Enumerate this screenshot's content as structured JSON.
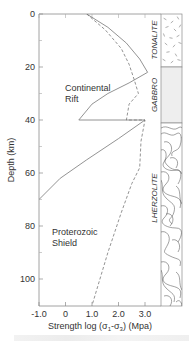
{
  "chart_data": {
    "type": "line",
    "title": "",
    "xlabel": "Strength log (σ1-σ3) (Mpa)",
    "xlabel_parts": {
      "prefix": "Strength log (σ",
      "sub1": "1",
      "mid": "-σ",
      "sub2": "3",
      "suffix": ") (Mpa)"
    },
    "ylabel": "Depth (km)",
    "xlim": [
      -1.0,
      3.6
    ],
    "ylim": [
      110,
      0
    ],
    "y_inverted": true,
    "x_ticks": [
      -1.0,
      0,
      1.0,
      2.0,
      3.0
    ],
    "x_tick_labels": [
      "-1.0",
      "0",
      "1.0",
      "2.0",
      "3.0"
    ],
    "y_ticks": [
      0,
      20,
      40,
      60,
      80,
      100
    ],
    "y_tick_labels": [
      "0",
      "20",
      "40",
      "60",
      "80",
      "100"
    ],
    "y_minor_ticks": [
      10,
      30,
      50,
      70,
      90
    ],
    "grid": false,
    "series": [
      {
        "name": "Continental Rift",
        "style": "solid",
        "points": [
          [
            0.8,
            0
          ],
          [
            1.6,
            5
          ],
          [
            2.3,
            11
          ],
          [
            2.8,
            17
          ],
          [
            3.1,
            22
          ],
          [
            2.4,
            26
          ],
          [
            1.6,
            30
          ],
          [
            1.0,
            34
          ],
          [
            0.5,
            40
          ],
          [
            3.0,
            40
          ],
          [
            2.0,
            47
          ],
          [
            0.8,
            55
          ],
          [
            -0.2,
            62
          ],
          [
            -1.0,
            70
          ]
        ]
      },
      {
        "name": "Proterozoic Shield",
        "style": "dashed",
        "points": [
          [
            0.8,
            0
          ],
          [
            1.5,
            6
          ],
          [
            2.1,
            13
          ],
          [
            2.4,
            19
          ],
          [
            2.6,
            25
          ],
          [
            2.75,
            30
          ],
          [
            2.4,
            34
          ],
          [
            2.3,
            40
          ],
          [
            3.0,
            40
          ],
          [
            2.85,
            48
          ],
          [
            2.8,
            58
          ],
          [
            2.5,
            64
          ],
          [
            2.1,
            75
          ],
          [
            1.6,
            90
          ],
          [
            1.0,
            110
          ]
        ]
      }
    ],
    "annotations": [
      {
        "text_lines": [
          "Continental",
          "Rift"
        ],
        "x": -0.3,
        "y": 29
      },
      {
        "text_lines": [
          "Proterozoic",
          "Shield"
        ],
        "x": -0.3,
        "y": 83
      }
    ],
    "lithology_column": [
      {
        "name": "TONALITE",
        "top": 0,
        "bottom": 20,
        "pattern": "speckled"
      },
      {
        "name": "GABBRO",
        "top": 20,
        "bottom": 41,
        "pattern": "light-gray"
      },
      {
        "name": "LHERZOLITE",
        "top": 41,
        "bottom": 110,
        "pattern": "contour-swirls"
      }
    ]
  }
}
